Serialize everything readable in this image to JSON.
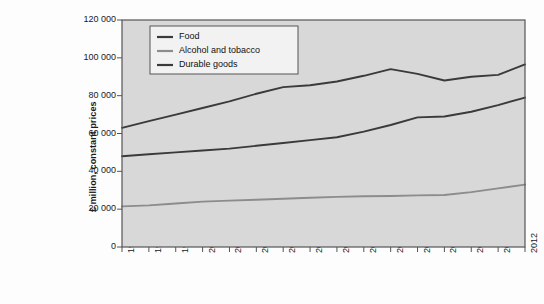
{
  "chart_data": {
    "type": "line",
    "title": "",
    "xlabel": "",
    "ylabel": "£ million, constant prices",
    "x": [
      1997,
      1998,
      1999,
      2000,
      2001,
      2002,
      2003,
      2004,
      2005,
      2006,
      2007,
      2008,
      2009,
      2010,
      2011,
      2012
    ],
    "xtick_labels": [
      "1997",
      "1998",
      "1999",
      "2000",
      "2001",
      "2002",
      "2003",
      "2004",
      "2005",
      "2006",
      "2007",
      "2008",
      "2009",
      "2010",
      "2011",
      "2012"
    ],
    "ytick_labels": [
      "0",
      "20 000",
      "40 000",
      "60 000",
      "80 000",
      "100 000",
      "120 000"
    ],
    "ytick_values": [
      0,
      20000,
      40000,
      60000,
      80000,
      100000,
      120000
    ],
    "ylim": [
      0,
      120000
    ],
    "xlim": [
      1997,
      2012
    ],
    "grid": false,
    "legend_position": "upper-left-inside",
    "series": [
      {
        "name": "Food",
        "color": "#3a3a3a",
        "values": [
          48000,
          49000,
          50000,
          51000,
          52000,
          53500,
          55000,
          56500,
          58000,
          61000,
          64500,
          68500,
          69000,
          71500,
          75000,
          79000
        ]
      },
      {
        "name": "Alcohol and tobacco",
        "color": "#8c8c8c",
        "values": [
          21500,
          22000,
          23000,
          24000,
          24500,
          25000,
          25500,
          26000,
          26500,
          26800,
          27000,
          27300,
          27500,
          29000,
          31000,
          33000
        ]
      },
      {
        "name": "Durable goods",
        "color": "#3a3a3a",
        "values": [
          63000,
          66500,
          70000,
          73500,
          77000,
          81000,
          84500,
          85500,
          87500,
          90500,
          94000,
          91500,
          88000,
          90000,
          91000,
          96500
        ]
      }
    ]
  },
  "legend": {
    "items": [
      {
        "label": "Food"
      },
      {
        "label": "Alcohol and tobacco"
      },
      {
        "label": "Durable goods"
      }
    ]
  },
  "colors": {
    "plot_background": "#d8d8d8",
    "plot_border": "#555555",
    "page_background": "#fdfdfd",
    "legend_background": "#f2f2f2",
    "text": "#1a1a1a"
  }
}
